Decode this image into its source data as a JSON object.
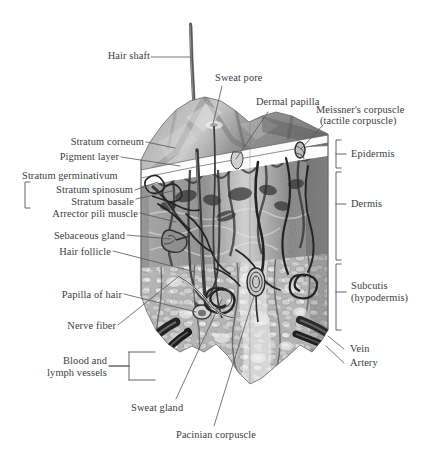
{
  "figure": {
    "kind": "anatomical-illustration",
    "style": "grayscale stipple engraving on white background",
    "width": 428,
    "height": 460,
    "text_color": "#3c3c46",
    "leader_color": "#55555f",
    "background": "#ffffff"
  },
  "labels": {
    "hair_shaft": "Hair shaft",
    "sweat_pore": "Sweat pore",
    "dermal_papilla": "Dermal papilla",
    "meissner_line1": "Meissner's corpuscle",
    "meissner_line2": "(tactile corpuscle)",
    "stratum_corneum": "Stratum corneum",
    "pigment_layer": "Pigment layer",
    "stratum_germinativum": "Stratum germinativum",
    "stratum_spinosum": "Stratum spinosum",
    "stratum_basale": "Stratum basale",
    "arrector_pili_muscle": "Arrector pili muscle",
    "sebaceous_gland": "Sebaceous gland",
    "hair_follicle": "Hair follicle",
    "papilla_of_hair": "Papilla of hair",
    "nerve_fiber": "Nerve fiber",
    "blood_lymph_line1": "Blood and",
    "blood_lymph_line2": "lymph vessels",
    "sweat_gland": "Sweat gland",
    "pacinian_corpuscle": "Pacinian corpuscle",
    "vein": "Vein",
    "artery": "Artery",
    "epidermis": "Epidermis",
    "dermis": "Dermis",
    "subcutis_line1": "Subcutis",
    "subcutis_line2": "(hypodermis)"
  },
  "layers": [
    {
      "name": "Epidermis",
      "bracket_top": 138,
      "bracket_bottom": 172
    },
    {
      "name": "Dermis",
      "bracket_top": 174,
      "bracket_bottom": 262
    },
    {
      "name": "Subcutis (hypodermis)",
      "bracket_top": 264,
      "bracket_bottom": 340
    }
  ],
  "structures": [
    "Hair shaft",
    "Sweat pore",
    "Dermal papilla",
    "Meissner's corpuscle (tactile corpuscle)",
    "Stratum corneum",
    "Pigment layer",
    "Stratum germinativum",
    "Stratum spinosum",
    "Stratum basale",
    "Arrector pili muscle",
    "Sebaceous gland",
    "Hair follicle",
    "Papilla of hair",
    "Nerve fiber",
    "Blood and lymph vessels",
    "Sweat gland",
    "Pacinian corpuscle",
    "Vein",
    "Artery"
  ]
}
